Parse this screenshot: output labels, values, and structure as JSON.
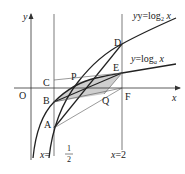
{
  "diagram": {
    "axes": {
      "x_label": "x",
      "y_label": "y",
      "origin_label": "O"
    },
    "curves": [
      {
        "name": "curve-log2",
        "label": "y=log",
        "base": "2",
        "var": "x"
      },
      {
        "name": "curve-loga",
        "label": "y=log",
        "base": "a",
        "var": "x"
      }
    ],
    "vertical_lines": [
      {
        "label_left": "x=",
        "num": "1",
        "den": "2"
      },
      {
        "label": "x=2"
      }
    ],
    "points": {
      "A": "A",
      "B": "B",
      "C": "C",
      "D": "D",
      "E": "E",
      "F": "F",
      "P": "P",
      "Q": "Q"
    },
    "colors": {
      "line": "#222222",
      "thin": "#555555",
      "shade": "#c8c8c8"
    }
  }
}
